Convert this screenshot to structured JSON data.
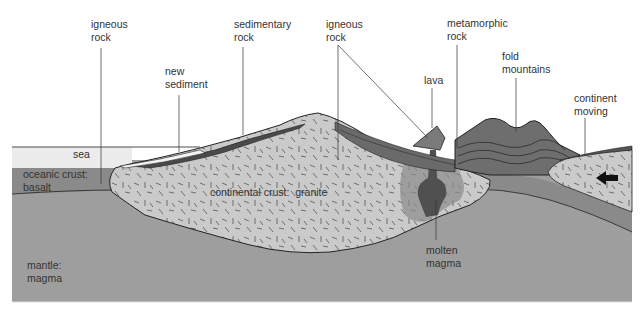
{
  "diagram": {
    "type": "geological cross-section",
    "colors": {
      "background": "#ffffff",
      "sea": "#ececec",
      "oceanic_crust": "#8e8e8e",
      "mantle": "#9d9d9d",
      "granite": "#c9c9c9",
      "sediment_dark": "#555555",
      "fold_mountains": "#6e6e6e",
      "molten_magma": "#4e4e4e",
      "outline": "#222222",
      "label_text": "#333333"
    },
    "labels": {
      "igneous_rock_left": "igneous\nrock",
      "new_sediment": "new\nsediment",
      "sedimentary_rock": "sedimentary\nrock",
      "igneous_rock_right": "igneous\nrock",
      "lava": "lava",
      "metamorphic_rock": "metamorphic\nrock",
      "fold_mountains": "fold\nmountains",
      "continent_moving": "continent\nmoving",
      "sea": "sea",
      "oceanic_crust": "oceanic crust:\nbasalt",
      "continental_crust": "continental crust:  granite",
      "mantle": "mantle:\nmagma",
      "molten_magma": "molten\nmagma"
    },
    "icons": {
      "direction_arrow": "arrow-left"
    }
  }
}
